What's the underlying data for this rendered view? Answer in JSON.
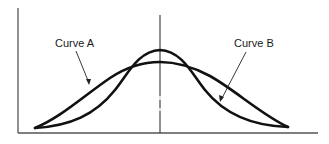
{
  "diagram": {
    "labels": {
      "curve_a": "Curve A",
      "curve_b": "Curve B"
    },
    "colors": {
      "curve": "#111111",
      "axis": "#555555",
      "center_line": "#333333",
      "text": "#1a1a1a",
      "background": "#ffffff"
    },
    "description": {
      "curve_a": "Broad, flatter bell curve",
      "curve_b": "Narrow, taller bell curve",
      "center_line": "Vertical line marking the shared mean"
    }
  }
}
